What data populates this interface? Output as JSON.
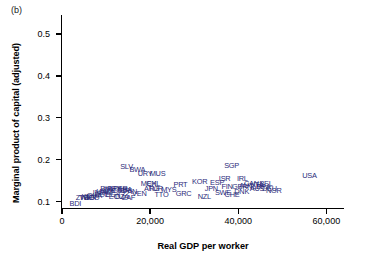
{
  "panel": {
    "label": "(b)"
  },
  "axes": {
    "ylabel": "Marginal product of capital (adjusted)",
    "xlabel": "Real GDP per worker",
    "yticks": [
      "0.1",
      "0.2",
      "0.3",
      "0.4",
      "0.5"
    ],
    "xticks": [
      "0",
      "20,000",
      "40,000",
      "60,000"
    ]
  },
  "style": {
    "label_color": "#2b2b7a",
    "axis_color": "#000000"
  },
  "chart_data": {
    "type": "scatter",
    "title": "(b)",
    "xlabel": "Real GDP per worker",
    "ylabel": "Marginal product of capital (adjusted)",
    "xlim": [
      0,
      64000
    ],
    "ylim": [
      0.085,
      0.545
    ],
    "xticks": [
      0,
      20000,
      40000,
      60000
    ],
    "yticks": [
      0.1,
      0.2,
      0.3,
      0.4,
      0.5
    ],
    "grid": false,
    "legend": null,
    "marker": "text-label",
    "points": [
      {
        "label": "BDI",
        "x": 1700,
        "y": 0.103
      },
      {
        "label": "ZWE",
        "x": 3100,
        "y": 0.118
      },
      {
        "label": "TGO",
        "x": 3900,
        "y": 0.119
      },
      {
        "label": "KEN",
        "x": 4400,
        "y": 0.121
      },
      {
        "label": "BGD",
        "x": 5000,
        "y": 0.118
      },
      {
        "label": "GHA",
        "x": 5600,
        "y": 0.124
      },
      {
        "label": "BOL",
        "x": 7400,
        "y": 0.126
      },
      {
        "label": "IND",
        "x": 7000,
        "y": 0.13
      },
      {
        "label": "HND",
        "x": 7800,
        "y": 0.133
      },
      {
        "label": "JAM",
        "x": 8300,
        "y": 0.133
      },
      {
        "label": "PHL",
        "x": 8700,
        "y": 0.14
      },
      {
        "label": "IDN",
        "x": 9300,
        "y": 0.138
      },
      {
        "label": "EGY",
        "x": 9900,
        "y": 0.125
      },
      {
        "label": "PRY",
        "x": 10200,
        "y": 0.14
      },
      {
        "label": "ECU",
        "x": 10600,
        "y": 0.12
      },
      {
        "label": "COL",
        "x": 11200,
        "y": 0.134
      },
      {
        "label": "PER",
        "x": 11600,
        "y": 0.14
      },
      {
        "label": "DZA",
        "x": 12000,
        "y": 0.12
      },
      {
        "label": "BRA",
        "x": 12600,
        "y": 0.138
      },
      {
        "label": "CRI",
        "x": 13100,
        "y": 0.134
      },
      {
        "label": "ZAF",
        "x": 13600,
        "y": 0.119
      },
      {
        "label": "PAN",
        "x": 13900,
        "y": 0.132
      },
      {
        "label": "SLV",
        "x": 13200,
        "y": 0.193
      },
      {
        "label": "BWA",
        "x": 15300,
        "y": 0.184
      },
      {
        "label": "VEN",
        "x": 15900,
        "y": 0.127
      },
      {
        "label": "URY",
        "x": 17200,
        "y": 0.176
      },
      {
        "label": "MUS",
        "x": 19900,
        "y": 0.176
      },
      {
        "label": "MEX",
        "x": 17900,
        "y": 0.152
      },
      {
        "label": "CHL",
        "x": 19100,
        "y": 0.152
      },
      {
        "label": "ARG",
        "x": 18600,
        "y": 0.14
      },
      {
        "label": "TUR",
        "x": 19600,
        "y": 0.139
      },
      {
        "label": "TTO",
        "x": 21000,
        "y": 0.126
      },
      {
        "label": "MYS",
        "x": 22500,
        "y": 0.138
      },
      {
        "label": "PRT",
        "x": 25300,
        "y": 0.15
      },
      {
        "label": "GRC",
        "x": 25800,
        "y": 0.128
      },
      {
        "label": "KOR",
        "x": 29500,
        "y": 0.157
      },
      {
        "label": "NZL",
        "x": 30800,
        "y": 0.121
      },
      {
        "label": "JPN",
        "x": 32400,
        "y": 0.139
      },
      {
        "label": "ESP",
        "x": 33600,
        "y": 0.153
      },
      {
        "label": "ISR",
        "x": 35600,
        "y": 0.163
      },
      {
        "label": "SWE",
        "x": 34700,
        "y": 0.131
      },
      {
        "label": "FIN",
        "x": 36200,
        "y": 0.144
      },
      {
        "label": "CHE",
        "x": 36900,
        "y": 0.126
      },
      {
        "label": "SGP",
        "x": 36800,
        "y": 0.195
      },
      {
        "label": "IRL",
        "x": 39700,
        "y": 0.163
      },
      {
        "label": "GBR",
        "x": 38600,
        "y": 0.144
      },
      {
        "label": "DNK",
        "x": 39100,
        "y": 0.133
      },
      {
        "label": "AUT",
        "x": 40200,
        "y": 0.148
      },
      {
        "label": "CAN",
        "x": 41300,
        "y": 0.152
      },
      {
        "label": "NLD",
        "x": 42000,
        "y": 0.145
      },
      {
        "label": "AUS",
        "x": 42600,
        "y": 0.14
      },
      {
        "label": "ITA",
        "x": 43400,
        "y": 0.149
      },
      {
        "label": "FRA",
        "x": 44100,
        "y": 0.145
      },
      {
        "label": "BEL",
        "x": 44800,
        "y": 0.152
      },
      {
        "label": "DEU",
        "x": 45400,
        "y": 0.139
      },
      {
        "label": "NOR",
        "x": 46300,
        "y": 0.136
      },
      {
        "label": "USA",
        "x": 54500,
        "y": 0.17
      }
    ]
  }
}
